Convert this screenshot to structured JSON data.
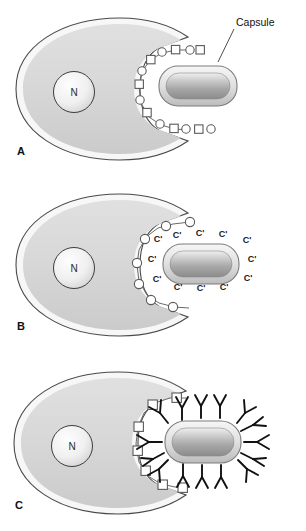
{
  "figure": {
    "width": 306,
    "height": 531
  },
  "colors": {
    "background": "#ffffff",
    "cell_outline": "#4a4a4a",
    "cell_membrane": "#f4f4f4",
    "cytoplasm_light": "#dcdcdc",
    "cytoplasm_dark": "#cfcfcf",
    "nucleus_light": "#fbfbfb",
    "nucleus_dark": "#d8d8d8",
    "nucleus_outline": "#3d3d3d",
    "capsule_ring_light": "#f2f2f2",
    "capsule_ring_dark": "#bdbdbd",
    "capsule_body_light": "#ececec",
    "capsule_body_mid": "#b0b0b0",
    "capsule_body_dark": "#8d8d8d",
    "capsule_outline": "#7d7d7d",
    "receptor_fill": "#ffffff",
    "receptor_outline": "#5a5a5a",
    "antibody": "#111111",
    "label_text": "#111111",
    "leader_line": "#3a3a3a"
  },
  "callout": {
    "label": "Capsule",
    "x": 236,
    "y": 22
  },
  "panels": [
    {
      "id": "A",
      "letter": "A",
      "nucleus_label": "N",
      "receptor_pattern": "alternating-square-circle",
      "receptor_count": 14,
      "capsule_present": true,
      "complement_labels": [],
      "antibody_count": 0,
      "caption": "Encapsulated bacterium resists attachment to phagocyte receptors"
    },
    {
      "id": "B",
      "letter": "B",
      "nucleus_label": "N",
      "receptor_pattern": "circles-only",
      "receptor_count": 8,
      "capsule_present": true,
      "complement_labels": [
        "C'",
        "C'",
        "C'",
        "C'",
        "C'",
        "C'",
        "C'",
        "C'",
        "C'",
        "C'",
        "C'",
        "C'"
      ],
      "complement_label_text": "C'",
      "complement_label_count": 12,
      "antibody_count": 0,
      "caption": "Complement coats the capsule surface"
    },
    {
      "id": "C",
      "letter": "C",
      "nucleus_label": "N",
      "receptor_pattern": "squares-only",
      "receptor_count": 8,
      "capsule_present": true,
      "complement_labels": [],
      "antibody_count": 15,
      "antibody_shape": "Y",
      "caption": "Antibody coats the capsule surface"
    }
  ]
}
